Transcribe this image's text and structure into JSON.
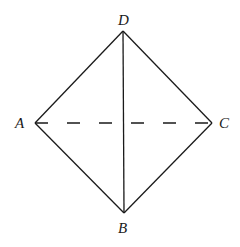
{
  "diagram": {
    "type": "geometry-figure",
    "vertices": {
      "A": {
        "label": "A",
        "x": 35,
        "y": 123
      },
      "B": {
        "label": "B",
        "x": 124,
        "y": 213
      },
      "C": {
        "label": "C",
        "x": 212,
        "y": 123
      },
      "D": {
        "label": "D",
        "x": 123,
        "y": 31
      }
    },
    "edges": [
      {
        "from": "D",
        "to": "A",
        "style": "solid"
      },
      {
        "from": "D",
        "to": "C",
        "style": "solid"
      },
      {
        "from": "A",
        "to": "B",
        "style": "solid"
      },
      {
        "from": "C",
        "to": "B",
        "style": "solid"
      },
      {
        "from": "D",
        "to": "B",
        "style": "solid"
      },
      {
        "from": "A",
        "to": "C",
        "style": "dashed"
      }
    ],
    "colors": {
      "stroke": "#1a1a1a",
      "background": "#ffffff"
    }
  }
}
